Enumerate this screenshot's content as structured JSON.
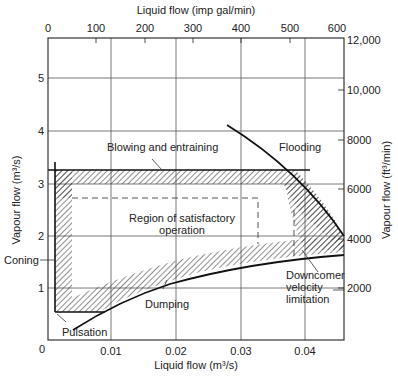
{
  "figure": {
    "top_axis_label": "Liquid flow (imp gal/min)",
    "bottom_axis_label": "Liquid flow (m³/s)",
    "left_axis_label": "Vapour flow (m³/s)",
    "right_axis_label": "Vapour flow (ft³/min)",
    "top_ticks": [
      "0",
      "100",
      "200",
      "300",
      "400",
      "500",
      "600"
    ],
    "bottom_ticks": [
      "0",
      "0.01",
      "0.02",
      "0.03",
      "0.04"
    ],
    "left_ticks": [
      "1",
      "2",
      "3",
      "4",
      "5"
    ],
    "right_ticks": [
      "12,000",
      "10,000",
      "8000",
      "6000",
      "4000",
      "2000"
    ],
    "annotations": {
      "blowing": "Blowing and entraining",
      "flooding": "Flooding",
      "region_line1": "Region of satisfactory",
      "region_line2": "operation",
      "coning": "Coning",
      "downcomer_line1": "Downcomer",
      "downcomer_line2": "velocity",
      "downcomer_line3": "limitation",
      "dumping": "Dumping",
      "pulsation": "Pulsation"
    }
  }
}
